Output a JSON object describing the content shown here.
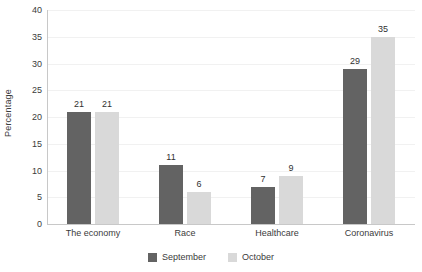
{
  "chart_data": {
    "type": "bar",
    "title": "",
    "subtitle": "",
    "xlabel": "",
    "ylabel": "Percentage",
    "ylim": [
      0,
      40
    ],
    "yticks": [
      0,
      5,
      10,
      15,
      20,
      25,
      30,
      35,
      40
    ],
    "ytick_labels": [
      "0",
      "5",
      "10",
      "15",
      "20",
      "25",
      "30",
      "35",
      "40"
    ],
    "grid": true,
    "legend_position": "bottom-center",
    "categories": [
      "The economy",
      "Race",
      "Healthcare",
      "Coronavirus"
    ],
    "series": [
      {
        "name": "September",
        "color": "#636363",
        "values": [
          21,
          11,
          7,
          29
        ],
        "labels": [
          "21",
          "11",
          "7",
          "29"
        ]
      },
      {
        "name": "October",
        "color": "#d9d9d9",
        "values": [
          21,
          6,
          9,
          35
        ],
        "labels": [
          "21",
          "6",
          "9",
          "35"
        ]
      }
    ]
  },
  "colors": {
    "september": "#636363",
    "october": "#d9d9d9",
    "gridline": "#f1f1f1",
    "axis": "#c8c8c8",
    "text": "#3b3b3b",
    "background": "#ffffff"
  }
}
